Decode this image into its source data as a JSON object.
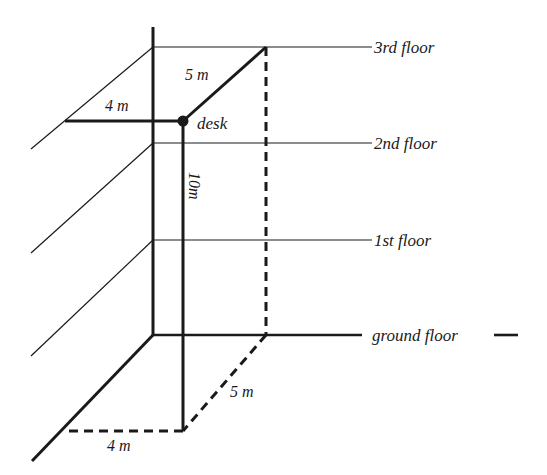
{
  "diagram": {
    "colors": {
      "ink": "#1a1a1a",
      "background": "#ffffff"
    },
    "floors": [
      {
        "id": "third",
        "label": "3rd floor"
      },
      {
        "id": "second",
        "label": "2nd floor"
      },
      {
        "id": "first",
        "label": "1st floor"
      },
      {
        "id": "ground",
        "label": "ground floor"
      }
    ],
    "point": {
      "label": "desk"
    },
    "measurements": {
      "top_horizontal": "4 m",
      "top_diagonal": "5 m",
      "vertical": "10m",
      "bottom_diagonal": "5 m",
      "bottom_horizontal": "4 m"
    }
  }
}
